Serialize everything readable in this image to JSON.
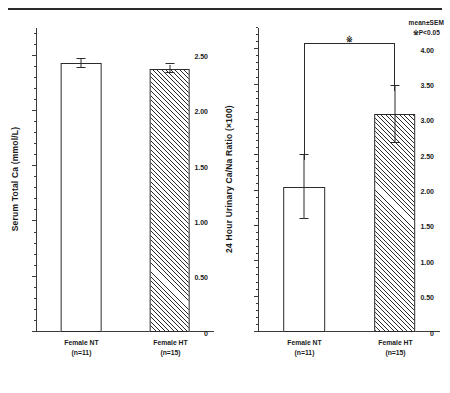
{
  "figure": {
    "legend": {
      "mean_note": "mean±SEM",
      "significance_note": "※P<0.05"
    }
  },
  "chart_data": [
    {
      "type": "bar",
      "panel": "left",
      "title": "",
      "xlabel": "",
      "ylabel": "Serum Total Ca (mmol/L)",
      "categories": [
        "Female NT",
        "Female HT"
      ],
      "category_sublabels": [
        "(n=11)",
        "(n=15)"
      ],
      "values": [
        2.43,
        2.38
      ],
      "errors": [
        0.04,
        0.04
      ],
      "fills": [
        "plain",
        "hatched"
      ],
      "ylim": [
        0,
        2.75
      ],
      "ymajor_ticks": [
        0,
        0.5,
        1.0,
        1.5,
        2.0,
        2.5
      ],
      "ytick_labels": [
        "0",
        "0.50",
        "1.00",
        "1.50",
        "2.00",
        "2.50"
      ],
      "yminor_step": 0.1,
      "grid": false,
      "significance": null,
      "legend_position": "none"
    },
    {
      "type": "bar",
      "panel": "right",
      "title": "",
      "xlabel": "",
      "ylabel": "24 Hour Urinary Ca/Na Ratio (×100)",
      "categories": [
        "Female NT",
        "Female HT"
      ],
      "category_sublabels": [
        "(n=11)",
        "(n=15)"
      ],
      "values": [
        2.05,
        3.08
      ],
      "errors": [
        0.45,
        0.4
      ],
      "fills": [
        "plain",
        "hatched"
      ],
      "ylim": [
        0,
        4.3
      ],
      "ymajor_ticks": [
        0,
        0.5,
        1.0,
        1.5,
        2.0,
        2.5,
        3.0,
        3.5,
        4.0
      ],
      "ytick_labels": [
        "0",
        "0.50",
        "1.00",
        "1.50",
        "2.00",
        "2.50",
        "3.00",
        "3.50",
        "4.00"
      ],
      "yminor_step": 0.1,
      "grid": false,
      "significance": {
        "marker": "※",
        "from": "Female NT",
        "to": "Female HT",
        "bracket_value": 4.08
      },
      "legend_position": "none"
    }
  ]
}
